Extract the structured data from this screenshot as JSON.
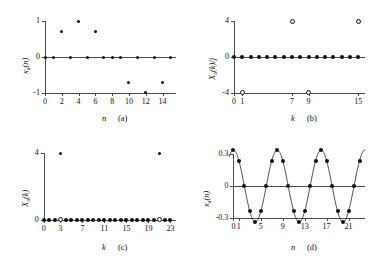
{
  "figure": {
    "background": "#ffffff",
    "axis_color": "#4a4a4a",
    "marker_color": "#111111"
  },
  "panels": [
    {
      "id": "a",
      "tag": "(a)",
      "xlabel": "n",
      "ylabel": "x_a(n)",
      "ylabel_main": "x",
      "ylabel_sub": "a",
      "ylabel_tail": "(n)",
      "xticks": [
        0,
        2,
        4,
        6,
        8,
        10,
        12,
        14
      ],
      "xticklabels": [
        "0",
        "2",
        "4",
        "6",
        "8",
        "10",
        "12",
        "14"
      ],
      "yticks": [
        -1,
        0,
        1
      ],
      "yticklabels": [
        "-1",
        "0",
        "1"
      ],
      "xlim": [
        -0.6,
        15.6
      ],
      "ylim": [
        -1.15,
        1.15
      ]
    },
    {
      "id": "b",
      "tag": "(b)",
      "xlabel": "k",
      "ylabel": "X_a(k)/j",
      "ylabel_main": "X",
      "ylabel_sub": "a",
      "ylabel_tail": "(k)/j",
      "xticks": [
        0,
        1,
        7,
        9,
        15
      ],
      "xticklabels": [
        "0",
        "1",
        "7",
        "9",
        "15"
      ],
      "yticks": [
        -4,
        0,
        4
      ],
      "yticklabels": [
        "-4",
        "0",
        "4"
      ],
      "xlim": [
        -0.6,
        15.8
      ],
      "ylim": [
        -4.6,
        4.6
      ]
    },
    {
      "id": "c",
      "tag": "(c)",
      "xlabel": "k",
      "ylabel": "X_a(k)",
      "ylabel_main": "X",
      "ylabel_sub": "a",
      "ylabel_tail": "(k)",
      "xticks": [
        0,
        3,
        7,
        11,
        15,
        19,
        23
      ],
      "xticklabels": [
        "0",
        "3",
        "7",
        "11",
        "15",
        "19",
        "23"
      ],
      "yticks": [
        0,
        4
      ],
      "yticklabels": [
        "0",
        "4"
      ],
      "xlim": [
        -0.7,
        24.0
      ],
      "ylim": [
        -0.45,
        4.5
      ]
    },
    {
      "id": "d",
      "tag": "(d)",
      "xlabel": "n",
      "ylabel": "x_a(n)",
      "ylabel_main": "x",
      "ylabel_sub": "a",
      "ylabel_tail": "(n)",
      "xticks": [
        0,
        1,
        5,
        9,
        13,
        17,
        21
      ],
      "xticklabels": [
        "0",
        "1",
        "5",
        "9",
        "13",
        "17",
        "21"
      ],
      "yticks": [
        -0.3,
        0,
        0.3
      ],
      "yticklabels": [
        "-0.3",
        "0",
        "0.3"
      ],
      "xlim": [
        -0.8,
        24.0
      ],
      "ylim": [
        -0.38,
        0.38
      ]
    }
  ],
  "chart_data": [
    {
      "type": "scatter",
      "panel": "a",
      "title": "",
      "xlabel": "n",
      "ylabel": "x_a(n)",
      "annotation": "(a)",
      "xlim": [
        -0.6,
        15.6
      ],
      "ylim": [
        -1.15,
        1.15
      ],
      "grid": false,
      "legend": "none",
      "x": [
        0,
        1,
        2,
        3,
        4,
        5,
        6,
        7,
        8,
        9,
        10,
        11,
        12,
        13,
        14,
        15
      ],
      "values": [
        0,
        0,
        0.707,
        0,
        1.0,
        0,
        0.707,
        0,
        0,
        0,
        -0.707,
        0,
        -1.0,
        0,
        -0.707,
        0
      ],
      "marker_styles": [
        "filled",
        "filled",
        "filled",
        "filled",
        "filled",
        "filled",
        "filled",
        "filled",
        "filled",
        "filled",
        "filled",
        "filled",
        "filled",
        "filled",
        "filled",
        "filled"
      ]
    },
    {
      "type": "scatter",
      "panel": "b",
      "title": "",
      "xlabel": "k",
      "ylabel": "X_a(k)/j",
      "annotation": "(b)",
      "xlim": [
        -0.6,
        15.8
      ],
      "ylim": [
        -4.6,
        4.6
      ],
      "grid": false,
      "legend": "none",
      "x": [
        0,
        1,
        2,
        3,
        4,
        5,
        6,
        7,
        8,
        9,
        10,
        11,
        12,
        13,
        14,
        15
      ],
      "values": [
        0,
        -4,
        0,
        0,
        0,
        0,
        0,
        4,
        0,
        -4,
        0,
        0,
        0,
        0,
        0,
        4
      ],
      "marker_styles": [
        "filled",
        "open",
        "filled",
        "filled",
        "filled",
        "filled",
        "filled",
        "open",
        "filled",
        "open",
        "filled",
        "filled",
        "filled",
        "filled",
        "filled",
        "open"
      ]
    },
    {
      "type": "scatter",
      "panel": "c",
      "title": "",
      "xlabel": "k",
      "ylabel": "X_a(k)",
      "annotation": "(c)",
      "xlim": [
        -0.7,
        24.0
      ],
      "ylim": [
        -0.45,
        4.5
      ],
      "grid": false,
      "legend": "none",
      "x": [
        0,
        1,
        2,
        3,
        4,
        5,
        6,
        7,
        8,
        9,
        10,
        11,
        12,
        13,
        14,
        15,
        16,
        17,
        18,
        19,
        20,
        21,
        22,
        23
      ],
      "values": [
        0,
        0,
        0,
        4,
        0,
        0,
        0,
        0,
        0,
        0,
        0,
        0,
        0,
        0,
        0,
        0,
        0,
        0,
        0,
        0,
        0,
        4,
        0,
        0
      ],
      "zero_markers": [
        "filled",
        "filled",
        "filled",
        "open",
        "filled",
        "filled",
        "filled",
        "filled",
        "filled",
        "filled",
        "filled",
        "filled",
        "filled",
        "filled",
        "filled",
        "filled",
        "filled",
        "filled",
        "filled",
        "filled",
        "filled",
        "open",
        "filled",
        "filled"
      ],
      "peak_indices": [
        3,
        21
      ]
    },
    {
      "type": "line",
      "panel": "d",
      "title": "",
      "xlabel": "n",
      "ylabel": "x_a(n)",
      "annotation": "(d)",
      "xlim": [
        -0.8,
        24.0
      ],
      "ylim": [
        -0.38,
        0.38
      ],
      "grid": false,
      "legend": "none",
      "amplitude": 0.333,
      "period_samples": 8,
      "phase": 0,
      "x": [
        0,
        1,
        2,
        3,
        4,
        5,
        6,
        7,
        8,
        9,
        10,
        11,
        12,
        13,
        14,
        15,
        16,
        17,
        18,
        19,
        20,
        21,
        22,
        23
      ],
      "values": [
        0.333,
        0.236,
        0.0,
        -0.236,
        -0.333,
        -0.236,
        0.0,
        0.236,
        0.333,
        0.236,
        0.0,
        -0.236,
        -0.333,
        -0.236,
        0.0,
        0.236,
        0.333,
        0.236,
        0.0,
        -0.236,
        -0.333,
        -0.236,
        0.0,
        0.236
      ]
    }
  ]
}
